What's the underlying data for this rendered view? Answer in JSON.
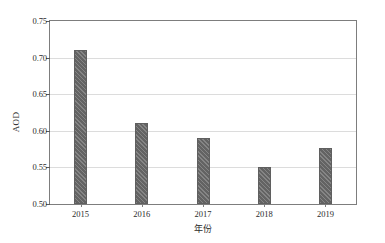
{
  "chart_data": {
    "type": "bar",
    "title": "",
    "xlabel": "年份",
    "ylabel": "AOD",
    "categories": [
      "2015",
      "2016",
      "2017",
      "2018",
      "2019"
    ],
    "values": [
      0.711,
      0.61,
      0.59,
      0.551,
      0.577
    ],
    "ylim": [
      0.5,
      0.75
    ],
    "yticks": [
      "0.50",
      "0.55",
      "0.60",
      "0.65",
      "0.70",
      "0.75"
    ],
    "ytick_values": [
      0.5,
      0.55,
      0.6,
      0.65,
      0.7,
      0.75
    ],
    "grid": true,
    "legend": "none",
    "series": [
      {
        "name": "AOD",
        "color": "#6e6e6e",
        "pattern": "diagonal-hatch",
        "values": [
          0.711,
          0.61,
          0.59,
          0.551,
          0.577
        ]
      }
    ]
  }
}
